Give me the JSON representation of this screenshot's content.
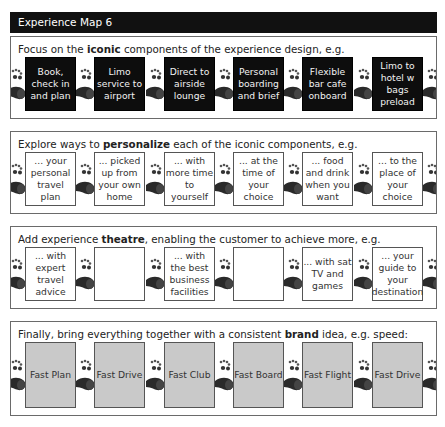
{
  "header": {
    "title": "Experience Map 6"
  },
  "sections": [
    {
      "title_pre": "Focus on the ",
      "title_bold": "iconic",
      "title_post": " components of the experience design, e.g.",
      "style": "black",
      "boxes": [
        "Book, check in and plan",
        "Limo service to airport",
        "Direct to airside lounge",
        "Personal boarding and brief",
        "Flexible bar cafe onboard",
        "Limo to hotel w bags preload"
      ]
    },
    {
      "title_pre": "Explore ways to ",
      "title_bold": "personalize",
      "title_post": " each of the iconic components, e.g.",
      "style": "white",
      "boxes": [
        "... your personal travel plan",
        "... picked up from your own home",
        "... with more time to yourself",
        "... at the time of your choice",
        "... food and drink when you want",
        "... to the place of your choice"
      ]
    },
    {
      "title_pre": "Add experience ",
      "title_bold": "theatre",
      "title_post": ", enabling the customer to achieve more, e.g.",
      "style": "white",
      "boxes": [
        "... with expert travel advice",
        "",
        "... with the best business facilities",
        "",
        "... with sat TV and games",
        "... your guide to your destination"
      ]
    },
    {
      "title_pre": "Finally, bring everything together with a consistent ",
      "title_bold": "brand",
      "title_post": " idea, e.g. speed:",
      "style": "gray",
      "boxes": [
        "Fast Plan",
        "Fast Drive",
        "Fast Club",
        "Fast Board",
        "Fast Flight",
        "Fast Drive"
      ]
    }
  ],
  "icons": {
    "connector": "footprints-icon"
  },
  "colors": {
    "header_bg": "#111111",
    "black_box": "#0d0d0d",
    "gray_box": "#c9c9c9",
    "border": "#6a6a6a"
  }
}
